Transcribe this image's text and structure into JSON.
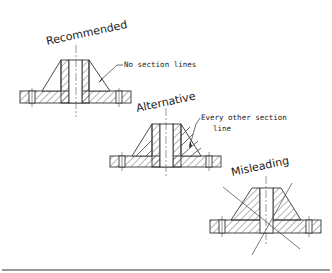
{
  "figures": [
    {
      "id": "recommended",
      "title": "Recommended",
      "callout": [
        "No section lines"
      ],
      "cx": 76,
      "flange_top": 91,
      "flange_bottom": 103,
      "boss_top": 60
    },
    {
      "id": "alternative",
      "title": "Alternative",
      "callout": [
        "Every other section",
        "line"
      ],
      "cx": 166,
      "flange_top": 156,
      "flange_bottom": 167,
      "boss_top": 124
    },
    {
      "id": "misleading",
      "title": "Misleading",
      "callout": [],
      "cx": 266,
      "flange_top": 220,
      "flange_bottom": 233,
      "boss_top": 188
    }
  ],
  "colors": {
    "line": "#333333",
    "hatch": "#444444",
    "background": "#ffffff"
  }
}
